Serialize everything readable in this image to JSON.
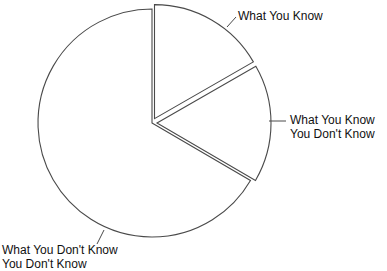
{
  "chart_data": {
    "type": "pie",
    "title": "",
    "categories": [
      "What You Know",
      "What You Know You Don't Know",
      "What You Don't Know You Don't Know"
    ],
    "values": [
      16.7,
      16.7,
      66.6
    ],
    "exploded": [
      true,
      true,
      false
    ],
    "start_angle_deg": 90,
    "direction": "clockwise",
    "fill_color": "#ffffff",
    "stroke_color": "#4a4a4a",
    "legend": "none (direct labels with leader lines)"
  },
  "labels": {
    "know": {
      "line1": "What You Know"
    },
    "know_dont_know": {
      "line1": "What You Know",
      "line2": "You Don't Know"
    },
    "dont_know": {
      "line1": "What You Don't Know",
      "line2": "You Don't Know"
    }
  }
}
